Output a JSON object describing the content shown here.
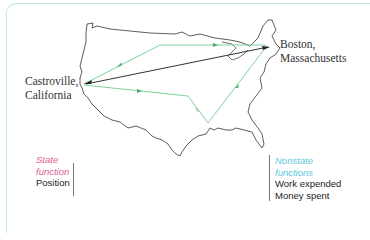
{
  "diagram": {
    "origin": {
      "label_line1": "Castroville,",
      "label_line2": "California"
    },
    "destination": {
      "label_line1": "Boston,",
      "label_line2": "Massachusetts"
    },
    "paths": {
      "direct_color": "#222222",
      "indirect_color": "#7ed39a"
    },
    "legend": {
      "state": {
        "heading_line1": "State",
        "heading_line2": "function",
        "heading_color": "#e0609a",
        "items": [
          "Position"
        ]
      },
      "nonstate": {
        "heading_line1": "Nonstate",
        "heading_line2": "functions",
        "heading_color": "#5cc8dc",
        "items": [
          "Work expended",
          "Money spent"
        ]
      }
    },
    "frame_color": "#bfe6ea"
  }
}
